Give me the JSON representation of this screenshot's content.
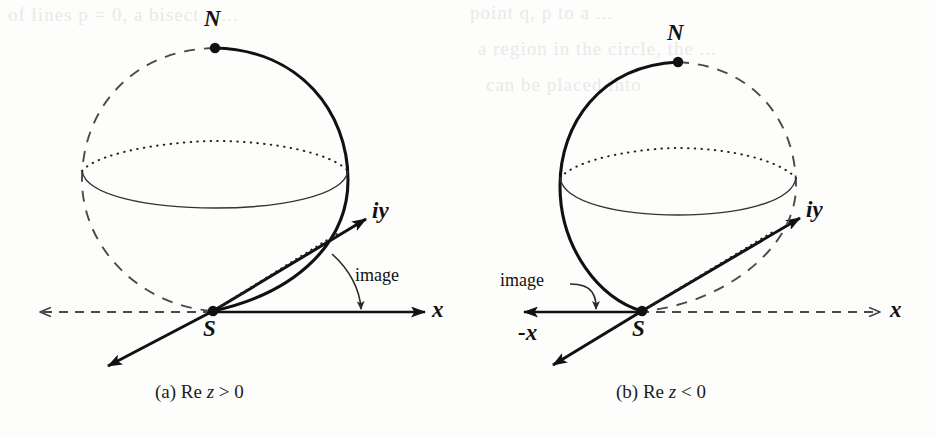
{
  "page": {
    "background_color": "#fdfdfc",
    "ink_color": "#111111"
  },
  "bleed_through_text": [
    "of lines p = 0, a bisect p ...",
    "point q, p to a ...",
    "a region in the circle, the ...",
    "can be placed into"
  ],
  "figures": [
    {
      "id": "a",
      "caption_prefix": "(a)",
      "caption_body": "Re",
      "caption_var": "z",
      "caption_rel": "> 0",
      "caption_full": "(a) Re z > 0",
      "north_pole_label": "N",
      "south_pole_label": "S",
      "vertical_axis_label": "iy",
      "horizontal_axis_label": "x",
      "annotation_label": "image",
      "negative_axis_label": null,
      "solid_meridian_side": "right",
      "dashed_meridian_side": "left",
      "solid_x_axis_direction": "right",
      "dashed_x_axis_direction": "left"
    },
    {
      "id": "b",
      "caption_prefix": "(b)",
      "caption_body": "Re",
      "caption_var": "z",
      "caption_rel": "< 0",
      "caption_full": "(b) Re z < 0",
      "north_pole_label": "N",
      "south_pole_label": "S",
      "vertical_axis_label": "iy",
      "horizontal_axis_label": "x",
      "annotation_label": "image",
      "negative_axis_label": "-x",
      "solid_meridian_side": "left",
      "dashed_meridian_side": "right",
      "solid_x_axis_direction": "left",
      "dashed_x_axis_direction": "right"
    }
  ]
}
